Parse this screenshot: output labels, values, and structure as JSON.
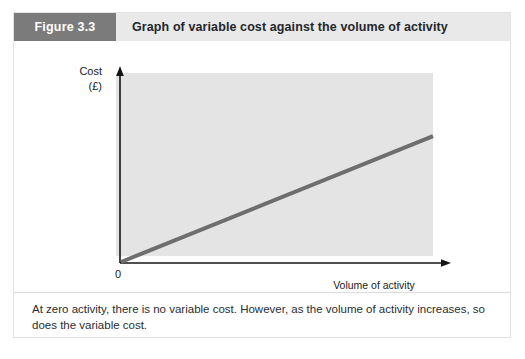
{
  "figure": {
    "number_label": "Figure 3.3",
    "title": "Graph of variable cost against the volume of activity",
    "caption": "At zero activity, there is no variable cost. However, as the volume of activity increases, so does the variable cost."
  },
  "colors": {
    "header_band": "#e9e9e9",
    "number_block": "#7b7b7b",
    "plot_background": "#e4e4e4",
    "line": "#6e6e6e",
    "axis": "#141414"
  },
  "chart_data": {
    "type": "line",
    "title": "Graph of variable cost against the volume of activity",
    "xlabel": "Volume of activity",
    "ylabel": "Cost",
    "ylabel_unit": "(£)",
    "origin_label": "0",
    "grid": false,
    "legend": "none",
    "xlim": [
      0,
      100
    ],
    "ylim": [
      0,
      100
    ],
    "axis_ticks": [],
    "series": [
      {
        "name": "Variable cost",
        "x": [
          0,
          100
        ],
        "values": [
          0,
          68
        ]
      }
    ],
    "annotations": []
  }
}
